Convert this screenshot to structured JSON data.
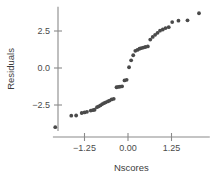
{
  "chart_data": {
    "type": "scatter",
    "title": "",
    "xlabel": "Nscores",
    "ylabel": "Residuals",
    "xlim": [
      -2.1,
      2.35
    ],
    "ylim": [
      -4.6,
      4.2
    ],
    "grid": false,
    "legend": null,
    "xticks": [
      -1.25,
      0.0,
      1.25
    ],
    "xticklabels": [
      "−1.25",
      "0.00",
      "1.25"
    ],
    "yticks": [
      -2.5,
      0.0,
      2.5
    ],
    "yticklabels": [
      "−2.5",
      "0.0",
      "2.5"
    ],
    "series": [
      {
        "name": "residuals",
        "marker": "circle",
        "color": "#4a4a4a",
        "points": [
          [
            -2.09,
            -4.0
          ],
          [
            -1.63,
            -3.22
          ],
          [
            -1.49,
            -3.21
          ],
          [
            -1.33,
            -3.04
          ],
          [
            -1.25,
            -3.0
          ],
          [
            -1.18,
            -2.96
          ],
          [
            -1.07,
            -2.88
          ],
          [
            -1.01,
            -2.85
          ],
          [
            -0.96,
            -2.82
          ],
          [
            -0.89,
            -2.65
          ],
          [
            -0.84,
            -2.59
          ],
          [
            -0.79,
            -2.52
          ],
          [
            -0.74,
            -2.44
          ],
          [
            -0.69,
            -2.38
          ],
          [
            -0.64,
            -2.32
          ],
          [
            -0.58,
            -2.26
          ],
          [
            -0.53,
            -2.2
          ],
          [
            -0.47,
            -2.12
          ],
          [
            -0.41,
            -2.08
          ],
          [
            -0.33,
            -1.3
          ],
          [
            -0.28,
            -1.28
          ],
          [
            -0.23,
            -1.26
          ],
          [
            -0.17,
            -1.24
          ],
          [
            -0.1,
            -0.84
          ],
          [
            -0.04,
            -0.8
          ],
          [
            0.03,
            0.05
          ],
          [
            0.09,
            0.52
          ],
          [
            0.15,
            0.86
          ],
          [
            0.21,
            1.16
          ],
          [
            0.27,
            1.22
          ],
          [
            0.33,
            1.3
          ],
          [
            0.38,
            1.34
          ],
          [
            0.44,
            1.38
          ],
          [
            0.5,
            1.42
          ],
          [
            0.57,
            1.46
          ],
          [
            0.64,
            1.92
          ],
          [
            0.71,
            2.1
          ],
          [
            0.78,
            2.24
          ],
          [
            0.85,
            2.38
          ],
          [
            0.92,
            2.52
          ],
          [
            1.0,
            2.6
          ],
          [
            1.08,
            2.7
          ],
          [
            1.17,
            2.76
          ],
          [
            1.27,
            3.1
          ],
          [
            1.45,
            3.2
          ],
          [
            1.71,
            3.22
          ],
          [
            2.04,
            3.7
          ]
        ]
      }
    ]
  },
  "axes": {
    "x_axis_name": "x-axis",
    "y_axis_name": "y-axis"
  }
}
